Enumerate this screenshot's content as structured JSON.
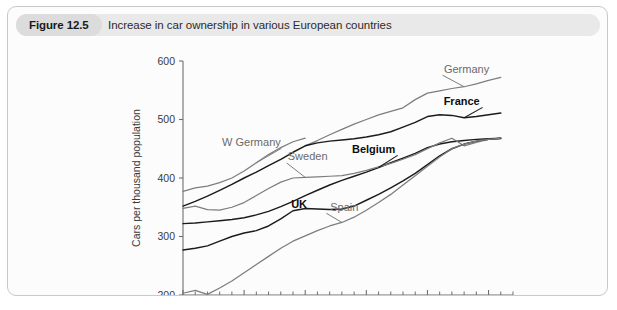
{
  "figure": {
    "number_label": "Figure 12.5",
    "caption": "Increase in car ownership in various European countries"
  },
  "chart_data": {
    "type": "line",
    "title": "Increase in car ownership in various European countries",
    "xlabel": "",
    "ylabel": "Cars per thousand population",
    "xlim": [
      1980,
      2007
    ],
    "ylim": [
      200,
      600
    ],
    "ytick_labels": [
      "200",
      "300",
      "400",
      "500",
      "600"
    ],
    "yticks": [
      200,
      300,
      400,
      500,
      600
    ],
    "xtick_labels": [
      "1980",
      "1985",
      "1990",
      "1995",
      "2000",
      "2005"
    ],
    "xticks": [
      1980,
      1985,
      1990,
      1995,
      2000,
      2005
    ],
    "xtick_minor_step": 1,
    "grid": false,
    "legend_position": "inline-annotations",
    "x": [
      1980,
      1981,
      1982,
      1983,
      1984,
      1985,
      1986,
      1987,
      1988,
      1989,
      1990,
      1991,
      1992,
      1993,
      1994,
      1995,
      1996,
      1997,
      1998,
      1999,
      2000,
      2001,
      2002,
      2003,
      2004,
      2005,
      2006
    ],
    "series": [
      {
        "name": "W Germany",
        "color": "#7d7d7d",
        "style": "gray",
        "label_x": 1985.6,
        "label_y": 455,
        "values": [
          377,
          383,
          386,
          392,
          400,
          412,
          426,
          440,
          452,
          462,
          468,
          null,
          null,
          null,
          null,
          null,
          null,
          null,
          null,
          null,
          null,
          null,
          null,
          null,
          null,
          null,
          null
        ]
      },
      {
        "name": "Germany",
        "color": "#7d7d7d",
        "style": "gray",
        "label_x": 2003.2,
        "label_y": 580,
        "values": [
          null,
          null,
          null,
          null,
          null,
          null,
          null,
          null,
          null,
          null,
          455,
          464,
          474,
          483,
          492,
          500,
          508,
          514,
          520,
          534,
          545,
          549,
          553,
          556,
          561,
          567,
          572
        ]
      },
      {
        "name": "France",
        "color": "#1b1b1b",
        "style": "dark",
        "label_x": 2002.8,
        "label_y": 525,
        "values": [
          352,
          360,
          369,
          379,
          389,
          400,
          410,
          421,
          432,
          444,
          455,
          460,
          463,
          465,
          467,
          470,
          474,
          479,
          487,
          495,
          505,
          508,
          507,
          503,
          505,
          508,
          511
        ]
      },
      {
        "name": "Belgium",
        "color": "#1b1b1b",
        "style": "dark",
        "label_x": 1995.6,
        "label_y": 443,
        "values": [
          322,
          323,
          325,
          327,
          329,
          332,
          337,
          343,
          351,
          360,
          370,
          379,
          388,
          396,
          403,
          410,
          418,
          426,
          434,
          442,
          452,
          458,
          462,
          464,
          466,
          467,
          468
        ]
      },
      {
        "name": "Sweden",
        "color": "#7d7d7d",
        "style": "gray",
        "label_x": 1990.2,
        "label_y": 430,
        "values": [
          348,
          352,
          346,
          345,
          350,
          358,
          370,
          382,
          393,
          400,
          401,
          402,
          403,
          404,
          408,
          413,
          419,
          425,
          432,
          440,
          450,
          460,
          468,
          455,
          461,
          466,
          467
        ]
      },
      {
        "name": "UK",
        "color": "#1b1b1b",
        "style": "dark",
        "label_x": 1989.5,
        "label_y": 348,
        "values": [
          277,
          280,
          284,
          292,
          300,
          306,
          310,
          318,
          330,
          344,
          348,
          347,
          346,
          347,
          352,
          362,
          372,
          383,
          395,
          408,
          423,
          438,
          450,
          458,
          463,
          466,
          468
        ]
      },
      {
        "name": "Spain",
        "color": "#7d7d7d",
        "style": "gray",
        "label_x": 1993.2,
        "label_y": 344,
        "values": [
          203,
          208,
          201,
          212,
          224,
          238,
          252,
          266,
          280,
          292,
          301,
          310,
          318,
          324,
          333,
          345,
          358,
          372,
          388,
          404,
          420,
          436,
          450,
          458,
          463,
          466,
          468
        ]
      }
    ]
  }
}
